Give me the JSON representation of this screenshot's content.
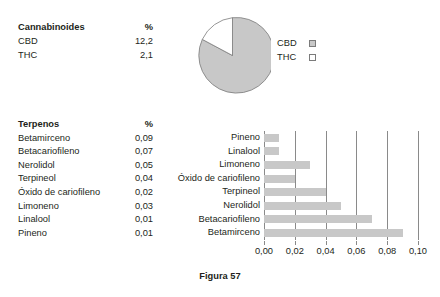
{
  "cannabinoid_table": {
    "header": {
      "name": "Cannabinoides",
      "value": "%"
    },
    "rows": [
      {
        "name": "CBD",
        "value": "12,2"
      },
      {
        "name": "THC",
        "value": "2,1"
      }
    ]
  },
  "pie_legend": [
    {
      "label": "CBD",
      "swatch": "filled"
    },
    {
      "label": "THC",
      "swatch": "empty"
    }
  ],
  "terpene_table": {
    "header": {
      "name": "Terpenos",
      "value": "%"
    },
    "rows": [
      {
        "name": "Betamirceno",
        "value": "0,09"
      },
      {
        "name": "Betacariofileno",
        "value": "0,07"
      },
      {
        "name": "Nerolidol",
        "value": "0,05"
      },
      {
        "name": "Terpineol",
        "value": "0,04"
      },
      {
        "name": "Óxido de cariofileno",
        "value": "0,02"
      },
      {
        "name": "Limoneno",
        "value": "0,03"
      },
      {
        "name": "Linalool",
        "value": "0,01"
      },
      {
        "name": "Pineno",
        "value": "0,01"
      }
    ]
  },
  "caption": "Figura 57",
  "colors": {
    "bar_fill": "#c8c8c8",
    "pie_fill": "#c8c8c8",
    "pie_empty": "#ffffff",
    "line": "#8a8a8a",
    "text": "#231f20"
  },
  "chart_data": [
    {
      "type": "pie",
      "title": "",
      "labels": [
        "CBD",
        "THC"
      ],
      "values": [
        12.2,
        2.1
      ],
      "unit": "%",
      "colors": [
        "#c8c8c8",
        "#ffffff"
      ],
      "legend_position": "right",
      "start_angle_deg": 0,
      "direction": "clockwise"
    },
    {
      "type": "bar",
      "orientation": "horizontal",
      "title": "",
      "xlabel": "",
      "ylabel": "",
      "categories": [
        "Pineno",
        "Linalool",
        "Limoneno",
        "Óxido de cariofileno",
        "Terpineol",
        "Nerolidol",
        "Betacariofileno",
        "Betamirceno"
      ],
      "values": [
        0.01,
        0.01,
        0.03,
        0.02,
        0.04,
        0.05,
        0.07,
        0.09
      ],
      "xlim": [
        0.0,
        0.1
      ],
      "xticks": [
        0.0,
        0.02,
        0.04,
        0.06,
        0.08,
        0.1
      ],
      "xtick_labels": [
        "0,00",
        "0,02",
        "0,04",
        "0,06",
        "0,08",
        "0,10"
      ],
      "grid": true,
      "legend": false
    }
  ]
}
